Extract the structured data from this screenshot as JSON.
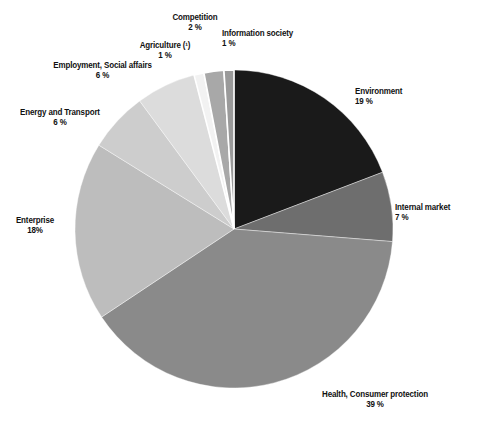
{
  "chart_data": {
    "type": "pie",
    "title": "",
    "subtitle": "",
    "xlabel": "",
    "ylabel": "",
    "legend_position": "none",
    "grid": false,
    "units": "%",
    "start_angle_deg": 0,
    "direction": "clockwise",
    "categories": [
      "Environment",
      "Internal market",
      "Health, Consumer protection",
      "Enterprise",
      "Energy and Transport",
      "Employment, Social affairs",
      "Agriculture (¹)",
      "Competition",
      "Information society"
    ],
    "values": [
      19,
      7,
      39,
      18,
      6,
      6,
      1,
      2,
      1
    ],
    "value_labels": [
      "19 %",
      "7 %",
      "39 %",
      "18%",
      "6 %",
      "6 %",
      "1 %",
      "2 %",
      "1 %"
    ],
    "colors": [
      "#1a1a1a",
      "#6e6e6e",
      "#8a8a8a",
      "#bdbdbd",
      "#cdcdcd",
      "#dcdcdc",
      "#f2f2f2",
      "#a8a8a8",
      "#9a9a9a"
    ],
    "slice_gap_color": "#ffffff"
  },
  "labels": {
    "environment": {
      "name": "Environment",
      "value": "19 %"
    },
    "internal": {
      "name": "Internal market",
      "value": "7 %"
    },
    "health": {
      "name": "Health, Consumer protection",
      "value": "39 %"
    },
    "enterprise": {
      "name": "Enterprise",
      "value": "18%"
    },
    "energy": {
      "name": "Energy and Transport",
      "value": "6 %"
    },
    "employment": {
      "name": "Employment, Social affairs",
      "value": "6 %"
    },
    "agriculture": {
      "name": "Agriculture (¹)",
      "value": "1 %"
    },
    "competition": {
      "name": "Competition",
      "value": "2 %"
    },
    "information": {
      "name": "Information society",
      "value": "1 %"
    }
  },
  "geometry": {
    "center_x": 234,
    "center_y": 229,
    "radius": 159
  }
}
